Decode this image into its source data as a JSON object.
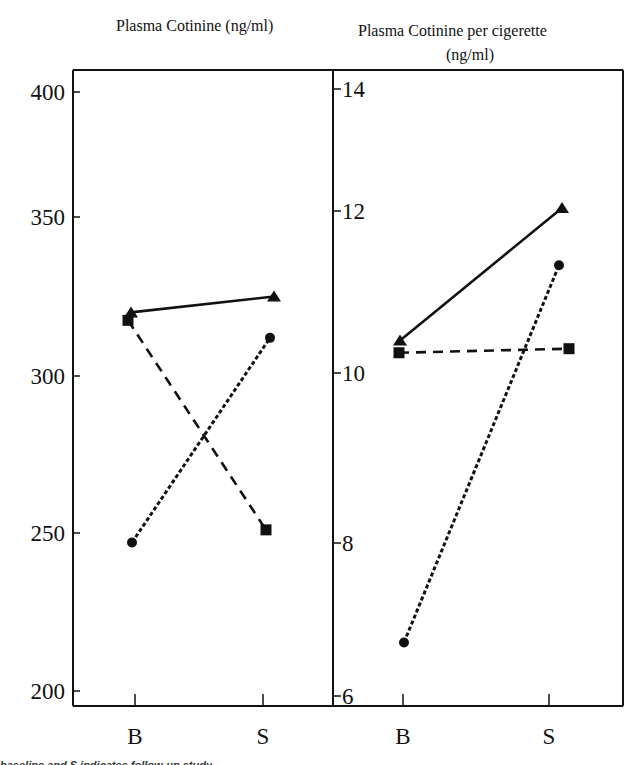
{
  "chart_data": [
    {
      "type": "line",
      "title": "Plasma Cotinine (ng/ml)",
      "xlabel": "",
      "ylabel": "",
      "categories": [
        "B",
        "S"
      ],
      "ylim": [
        195,
        404
      ],
      "yticks": [
        200,
        250,
        300,
        350,
        400
      ],
      "grid": false,
      "legend": "none",
      "series": [
        {
          "name": "triangle-solid",
          "marker": "triangle",
          "style": "solid",
          "values": [
            320,
            325
          ]
        },
        {
          "name": "square-dashed",
          "marker": "square",
          "style": "dashed",
          "values": [
            317.5,
            251
          ]
        },
        {
          "name": "circle-dotted",
          "marker": "circle",
          "style": "dotted",
          "values": [
            247,
            312
          ]
        }
      ]
    },
    {
      "type": "line",
      "title": "Plasma Cotinine per cigerette (ng/ml)",
      "xlabel": "",
      "ylabel": "",
      "categories": [
        "B",
        "S"
      ],
      "ylim": [
        5.9,
        14.2
      ],
      "yticks": [
        6,
        8,
        10,
        12,
        14
      ],
      "grid": false,
      "legend": "none",
      "series": [
        {
          "name": "triangle-solid",
          "marker": "triangle",
          "style": "solid",
          "values": [
            10.4,
            12.05
          ]
        },
        {
          "name": "square-dashed",
          "marker": "square",
          "style": "dashed",
          "values": [
            10.25,
            10.3
          ]
        },
        {
          "name": "circle-dotted",
          "marker": "circle",
          "style": "dotted",
          "values": [
            6.7,
            11.33
          ]
        }
      ]
    }
  ],
  "titles": {
    "left": "Plasma Cotinine (ng/ml)",
    "right_line1": "Plasma Cotinine per cigerette",
    "right_line2": "(ng/ml)"
  },
  "caption": "baseline and S indicates follow-up study"
}
